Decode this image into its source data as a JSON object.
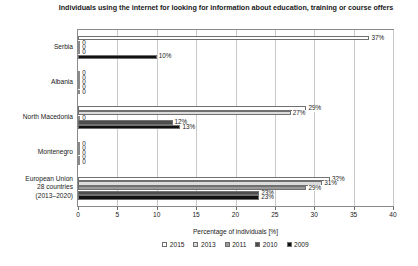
{
  "chart_data": {
    "type": "bar",
    "orientation": "horizontal",
    "title": "Individuals using the internet for looking for information about education, training or course offers",
    "xlabel": "Percentage of individuals [%]",
    "ylabel": "",
    "xlim": [
      0,
      40
    ],
    "xticks": [
      0,
      5,
      10,
      15,
      20,
      25,
      30,
      35,
      40
    ],
    "grid": true,
    "legend_position": "bottom",
    "categories": [
      "Serbia",
      "Albania",
      "North Macedonia",
      "Montenegro",
      "European Union 28 countries (2013–2020)"
    ],
    "category_lines": [
      [
        "Serbia"
      ],
      [
        "Albania"
      ],
      [
        "North Macedonia"
      ],
      [
        "Montenegro"
      ],
      [
        "European Union",
        "28 countries",
        "(2013–2020)"
      ]
    ],
    "series": [
      {
        "name": "2015",
        "color": "#ffffff",
        "values": [
          37,
          0,
          29,
          0,
          32
        ],
        "labels": [
          "37%",
          "0",
          "29%",
          "0",
          "32%"
        ]
      },
      {
        "name": "2013",
        "color": "#dcdcdc",
        "values": [
          0,
          0,
          27,
          0,
          31
        ],
        "labels": [
          "0",
          "0",
          "27%",
          "0",
          "31%"
        ]
      },
      {
        "name": "2011",
        "color": "#9a9a9a",
        "values": [
          0,
          0,
          0,
          0,
          29
        ],
        "labels": [
          "0",
          "0",
          "0",
          "0",
          "29%"
        ]
      },
      {
        "name": "2010",
        "color": "#4d4d4d",
        "values": [
          0,
          0,
          12,
          0,
          23
        ],
        "labels": [
          "0",
          "0",
          "12%",
          "0",
          "23%"
        ]
      },
      {
        "name": "2009",
        "color": "#111111",
        "values": [
          10,
          0,
          13,
          0,
          23
        ],
        "labels": [
          "10%",
          "0",
          "13%",
          "0",
          "23%"
        ]
      }
    ]
  }
}
